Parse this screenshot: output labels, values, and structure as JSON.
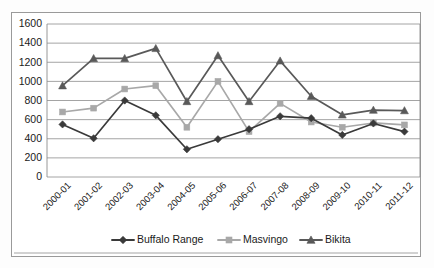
{
  "chart_data": {
    "type": "line",
    "title": "",
    "xlabel": "",
    "ylabel": "",
    "ylim": [
      0,
      1600
    ],
    "ytick_step": 200,
    "yticks": [
      "0",
      "200",
      "400",
      "600",
      "800",
      "1000",
      "1200",
      "1400",
      "1600"
    ],
    "grid": true,
    "legend_position": "bottom",
    "categories": [
      "2000-01",
      "2001-02",
      "2002-03",
      "2003-04",
      "2004-05",
      "2005-06",
      "2006-07",
      "2007-08",
      "2008-09",
      "2009-10",
      "2010-11",
      "2011-12"
    ],
    "series": [
      {
        "name": "Buffalo Range",
        "marker": "diamond",
        "color": "#3a3a3a",
        "values": [
          550,
          405,
          800,
          645,
          290,
          395,
          500,
          635,
          615,
          440,
          560,
          475
        ]
      },
      {
        "name": "Masvingo",
        "marker": "square",
        "color": "#a8a8a8",
        "values": [
          680,
          720,
          920,
          955,
          520,
          1000,
          475,
          770,
          575,
          520,
          565,
          545
        ]
      },
      {
        "name": "Bikita",
        "marker": "triangle",
        "color": "#595959",
        "values": [
          955,
          1240,
          1240,
          1345,
          790,
          1270,
          790,
          1215,
          845,
          650,
          700,
          695
        ]
      }
    ]
  },
  "legend": {
    "items": [
      {
        "label": "Buffalo Range",
        "color": "#3a3a3a",
        "marker": "diamond"
      },
      {
        "label": "Masvingo",
        "color": "#a8a8a8",
        "marker": "square"
      },
      {
        "label": "Bikita",
        "color": "#595959",
        "marker": "triangle"
      }
    ]
  }
}
